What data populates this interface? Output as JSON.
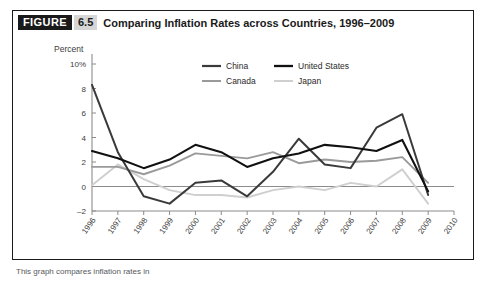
{
  "figure": {
    "badge_word": "FIGURE",
    "badge_number": "6.5",
    "title": "Comparing Inflation Rates across Countries, 1996–2009"
  },
  "footnote": {
    "text": "This graph compares inflation rates in"
  },
  "colors": {
    "china": "#3a3a3a",
    "united_states": "#111111",
    "canada": "#9a9a9a",
    "japan": "#cfcfcf",
    "axis": "#8c8c8c",
    "text": "#3d3d3d",
    "frame": "#1a1a1a",
    "badge_bg": "#1a1a1a",
    "badge_num_bg": "#d6d6d6"
  },
  "chart_data": {
    "type": "line",
    "title": "Comparing Inflation Rates across Countries, 1996–2009",
    "xlabel": "Year",
    "ylabel": "Percent",
    "ytick_labels": [
      "10%",
      "8",
      "6",
      "4",
      "2",
      "0",
      "–2"
    ],
    "ytick_values": [
      10,
      8,
      6,
      4,
      2,
      0,
      -2
    ],
    "ylim": [
      -2,
      10
    ],
    "xlim": [
      1996,
      2010
    ],
    "grid": false,
    "zero_line": true,
    "legend_position": "top-center",
    "x": [
      1996,
      1997,
      1998,
      1999,
      2000,
      2001,
      2002,
      2003,
      2004,
      2005,
      2006,
      2007,
      2008,
      2009
    ],
    "xtick_labels": [
      "1996",
      "1997",
      "1998",
      "1999",
      "2000",
      "2001",
      "2002",
      "2003",
      "2004",
      "2005",
      "2006",
      "2007",
      "2008",
      "2009",
      "2010"
    ],
    "series": [
      {
        "name": "China",
        "color": "#3a3a3a",
        "values": [
          8.3,
          2.8,
          -0.8,
          -1.4,
          0.3,
          0.5,
          -0.8,
          1.2,
          3.9,
          1.8,
          1.5,
          4.8,
          5.9,
          -0.7
        ]
      },
      {
        "name": "United States",
        "color": "#111111",
        "values": [
          2.9,
          2.3,
          1.5,
          2.2,
          3.4,
          2.8,
          1.6,
          2.3,
          2.7,
          3.4,
          3.2,
          2.9,
          3.8,
          -0.4
        ]
      },
      {
        "name": "Canada",
        "color": "#9a9a9a",
        "values": [
          1.6,
          1.6,
          1.0,
          1.7,
          2.7,
          2.5,
          2.3,
          2.8,
          1.9,
          2.2,
          2.0,
          2.1,
          2.4,
          0.3
        ]
      },
      {
        "name": "Japan",
        "color": "#cfcfcf",
        "values": [
          0.1,
          1.8,
          0.6,
          -0.3,
          -0.7,
          -0.7,
          -0.9,
          -0.3,
          0.0,
          -0.3,
          0.3,
          0.0,
          1.4,
          -1.4
        ]
      }
    ],
    "legend": [
      {
        "label": "China",
        "color": "#3a3a3a"
      },
      {
        "label": "United States",
        "color": "#111111"
      },
      {
        "label": "Canada",
        "color": "#9a9a9a"
      },
      {
        "label": "Japan",
        "color": "#cfcfcf"
      }
    ]
  }
}
